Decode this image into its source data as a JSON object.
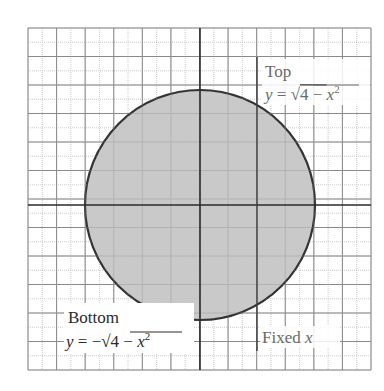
{
  "diagram": {
    "type": "region-between-curves",
    "grid": {
      "cells_x": 12,
      "cells_y": 12,
      "left": 28,
      "top": 28,
      "right": 371,
      "bottom": 370,
      "major_line_color": "#8a8a8a",
      "minor_line_color": "#c8c8c8"
    },
    "axes": {
      "origin_px": [
        200,
        205
      ],
      "color": "#2a2a2a"
    },
    "circle": {
      "center_px": [
        200,
        205
      ],
      "radius_px": 115,
      "fill": "#c9c9c9",
      "stroke": "#333333"
    },
    "fixed_x_line": {
      "x_px": 257,
      "y_top_px": 57,
      "y_bottom_px": 351,
      "color": "#3a3a3a"
    },
    "labels": {
      "top_title": "Top",
      "top_equation": "y = √4 − x²",
      "top_eq_y": "y",
      "top_eq_eq": " = ",
      "top_eq_sqrt": "√",
      "top_eq_radicand": "4 − ",
      "top_eq_x": "x",
      "top_eq_exp": "2",
      "bottom_title": "Bottom",
      "bottom_equation": "y = −√4 − x²",
      "bottom_eq_y": "y",
      "bottom_eq_eq": " = −",
      "bottom_eq_sqrt": "√",
      "bottom_eq_radicand": "4 − ",
      "bottom_eq_x": "x",
      "bottom_eq_exp": "2",
      "fixed_text": "Fixed ",
      "fixed_var": "x"
    }
  }
}
